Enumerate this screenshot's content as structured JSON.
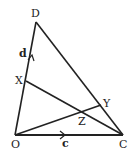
{
  "diagram": {
    "type": "geometry-triangle",
    "points": {
      "O": {
        "label": "O",
        "x": 15,
        "y": 135
      },
      "C": {
        "label": "C",
        "x": 123,
        "y": 135
      },
      "D": {
        "label": "D",
        "x": 36,
        "y": 22
      },
      "X": {
        "label": "X",
        "x": 26,
        "y": 81
      },
      "Y": {
        "label": "Y",
        "x": 101,
        "y": 105
      },
      "Z": {
        "label": "Z",
        "x": 82,
        "y": 111
      }
    },
    "segments": [
      {
        "from": "O",
        "to": "C",
        "vector": "c"
      },
      {
        "from": "O",
        "to": "D",
        "vector": "d"
      },
      {
        "from": "D",
        "to": "C"
      },
      {
        "from": "X",
        "to": "C"
      },
      {
        "from": "O",
        "to": "Y"
      }
    ],
    "vector_labels": {
      "c": "c",
      "d": "d"
    },
    "line_color": "#222222"
  }
}
